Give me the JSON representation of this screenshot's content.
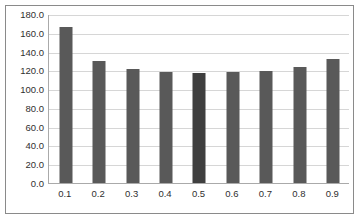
{
  "chart_data": {
    "type": "bar",
    "title": "",
    "subtitle": "",
    "xlabel": "",
    "ylabel": "",
    "categories": [
      "0.1",
      "0.2",
      "0.3",
      "0.4",
      "0.5",
      "0.6",
      "0.7",
      "0.8",
      "0.9"
    ],
    "values": [
      166.0,
      130.0,
      121.0,
      118.0,
      117.0,
      118.0,
      119.5,
      124.0,
      132.0
    ],
    "series": [
      {
        "name": "",
        "values": [
          166.0,
          130.0,
          121.0,
          118.0,
          117.0,
          118.0,
          119.5,
          124.0,
          132.0
        ]
      }
    ],
    "ylim": [
      0.0,
      180.0
    ],
    "ytick_step": 20.0,
    "ytick_labels": [
      "180.0",
      "160.0",
      "140.0",
      "120.0",
      "100.0",
      "80.0",
      "60.0",
      "40.0",
      "20.0",
      "0.0"
    ],
    "ytick_values": [
      180.0,
      160.0,
      140.0,
      120.0,
      100.0,
      80.0,
      60.0,
      40.0,
      20.0,
      0.0
    ],
    "xtick_labels": [
      "0.1",
      "0.2",
      "0.3",
      "0.4",
      "0.5",
      "0.6",
      "0.7",
      "0.8",
      "0.9"
    ],
    "grid": true,
    "grid_orientation": "horizontal",
    "legend": false,
    "legend_position": "none",
    "highlighted_index": 4,
    "annotations": []
  },
  "style": {
    "bar_color": "#595959",
    "bar_highlight_color": "#3f3f3f",
    "gridline_color": "#d6d6d6",
    "axis_color": "#aaaaaa",
    "border_color": "#8a8a8a",
    "text_color": "#2f2f2f",
    "background_color": "#ffffff"
  }
}
